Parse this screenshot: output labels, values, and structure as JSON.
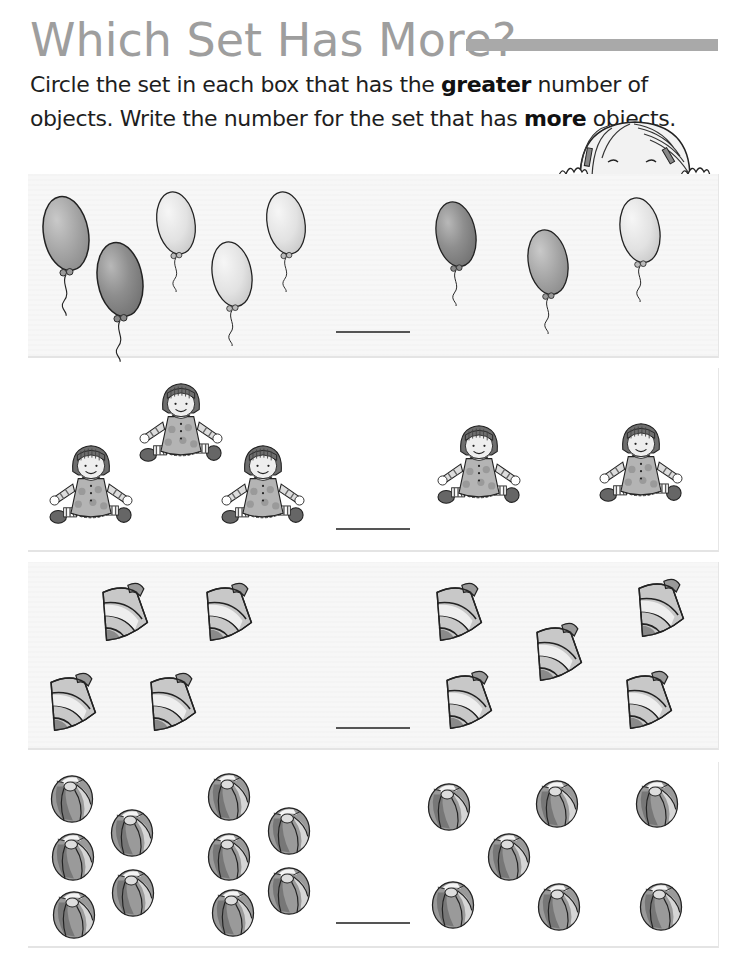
{
  "worksheet": {
    "title": "Which Set Has More?",
    "instructions": {
      "part1": "Circle the set in each box that has the ",
      "bold1": "greater",
      "part2": " number of objects. Write the number for the set that has ",
      "bold2": "more",
      "part3": " objects."
    },
    "colors": {
      "title": "#9e9e9e",
      "title_bar": "#a9a9a9",
      "text": "#1e1e1e",
      "shaded_box": "#f7f7f7",
      "answer_line": "#555555"
    },
    "decoration": "girl-peeking-illustration",
    "problems": [
      {
        "object": "balloon",
        "left_set_count": 5,
        "right_set_count": 3,
        "answer_blank": ""
      },
      {
        "object": "rag-doll",
        "left_set_count": 3,
        "right_set_count": 2,
        "answer_blank": ""
      },
      {
        "object": "seashell",
        "left_set_count": 4,
        "right_set_count": 5,
        "answer_blank": ""
      },
      {
        "object": "beach-ball",
        "left_set_count": 10,
        "right_set_count": 7,
        "answer_blank": ""
      }
    ]
  }
}
